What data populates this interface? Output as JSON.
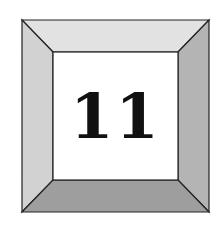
{
  "badge": {
    "number": "11",
    "colors": {
      "top_bevel": "#e2e2e2",
      "left_bevel": "#d2d2d2",
      "right_bevel": "#b4b4b4",
      "bottom_bevel": "#9e9e9e",
      "face": "#ffffff",
      "outline": "#222222",
      "text": "#111111"
    }
  }
}
